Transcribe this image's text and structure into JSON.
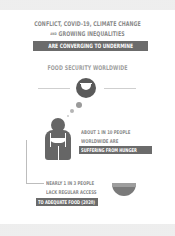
{
  "header": {
    "line1": "CONFLICT, COVID-19, CLIMATE CHANGE",
    "line2_small": "AND",
    "line2": "GROWING INEQUALITIES",
    "line3_highlight": "ARE CONVERGING TO UNDERMINE",
    "line4": "FOOD SECURITY WORLDWIDE"
  },
  "stat1": {
    "line1": "ABOUT 1 IN 10 PEOPLE",
    "line2": "WORLDWIDE ARE",
    "highlight": "SUFFERING FROM HUNGER"
  },
  "stat2": {
    "line1": "NEARLY 1 IN 3 PEOPLE",
    "line2": "LACK REGULAR ACCESS",
    "highlight": "TO ADEQUATE FOOD (2020)"
  },
  "icons": {
    "thought_bowl": "empty-bowl-icon",
    "person": "hungry-person-icon",
    "bowl": "bowl-icon"
  },
  "colors": {
    "text": "#8a8a8a",
    "highlight_bg": "#6b6b6b",
    "icon": "#666666"
  }
}
